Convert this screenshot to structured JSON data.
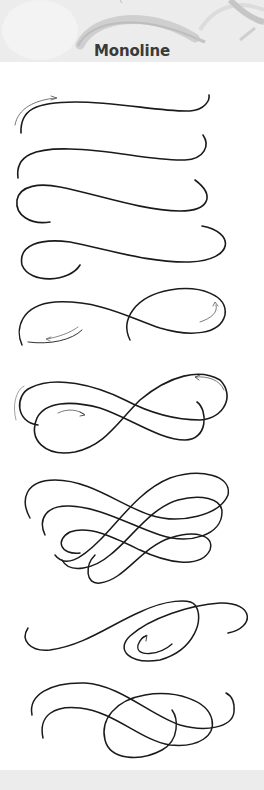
{
  "header": {
    "title": "Monoline",
    "background": "#ececec",
    "title_color": "#3a3a3a"
  },
  "illustration": {
    "description": "Stacked progression of monoline calligraphy flourishes with direction arrows",
    "stroke_color": "#1a1a1a",
    "flourishes": [
      {
        "index": 1,
        "name": "single-swash-with-arrow"
      },
      {
        "index": 2,
        "name": "single-swash"
      },
      {
        "index": 3,
        "name": "swash-with-lower-hook"
      },
      {
        "index": 4,
        "name": "swash-with-long-hook"
      },
      {
        "index": 5,
        "name": "swash-with-loop-and-arrows"
      },
      {
        "index": 6,
        "name": "figure-eight-with-arrows"
      },
      {
        "index": 7,
        "name": "triple-figure-eight"
      },
      {
        "index": 8,
        "name": "swash-with-inner-spiral"
      },
      {
        "index": 9,
        "name": "double-swash-with-loop"
      }
    ]
  },
  "footer": {
    "background": "#ececec"
  }
}
